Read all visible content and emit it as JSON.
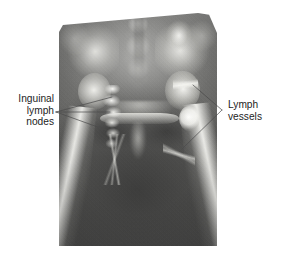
{
  "figure": {
    "kind": "radiograph-lymphangiogram",
    "region": "pelvis-and-proximal-femora",
    "modality_label": "x-ray",
    "background_color": "#ffffff",
    "plate_bounds": {
      "x": 59,
      "y": 12,
      "width": 158,
      "height": 234
    }
  },
  "annotations": {
    "left": {
      "name": "inguinal-lymph-nodes",
      "lines": [
        "Inguinal",
        "lymph",
        "nodes"
      ],
      "text": "Inguinal\nlymph\nnodes",
      "align": "right",
      "text_color": "#1d1d1d",
      "leader_apex": {
        "x": 56,
        "y": 112
      },
      "leader_targets": [
        {
          "x": 112,
          "y": 97
        },
        {
          "x": 110,
          "y": 112
        },
        {
          "x": 106,
          "y": 130
        }
      ]
    },
    "right": {
      "name": "lymph-vessels",
      "lines": [
        "Lymph",
        "vessels"
      ],
      "text": "Lymph\nvessels",
      "align": "left",
      "text_color": "#1d1d1d",
      "leader_apex": {
        "x": 222,
        "y": 110
      },
      "leader_targets": [
        {
          "x": 193,
          "y": 85
        },
        {
          "x": 182,
          "y": 149
        }
      ]
    }
  },
  "leader_style": {
    "stroke": "#4a4a4a",
    "stroke_width": 0.7
  },
  "structures": [
    {
      "name": "sacrum",
      "brightness": "bright"
    },
    {
      "name": "iliac-wing-left",
      "brightness": "bright"
    },
    {
      "name": "iliac-wing-right",
      "brightness": "bright"
    },
    {
      "name": "femoral-head-left",
      "brightness": "bright"
    },
    {
      "name": "femoral-head-right",
      "brightness": "bright"
    },
    {
      "name": "pubic-symphysis",
      "brightness": "mid"
    },
    {
      "name": "femoral-shaft-left",
      "brightness": "bright"
    },
    {
      "name": "femoral-shaft-right",
      "brightness": "bright"
    },
    {
      "name": "inguinal-node-chain-left",
      "brightness": "contrast-opacified"
    },
    {
      "name": "inguinal-node-right",
      "brightness": "contrast-opacified"
    },
    {
      "name": "lymph-vessel-right-upper",
      "brightness": "contrast-opacified"
    },
    {
      "name": "lymph-vessel-right-lower",
      "brightness": "contrast-opacified"
    }
  ]
}
